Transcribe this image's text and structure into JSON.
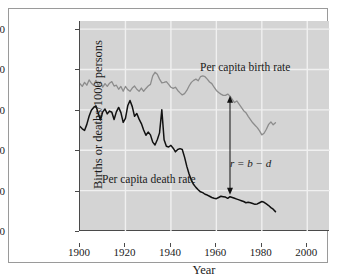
{
  "figure": {
    "background": "#ffffff",
    "plot_background": "#d4d4d4",
    "axis_color": "#4a4a4a",
    "gridline_color": "#f0f0f0",
    "frame_color": "#9a9a9a"
  },
  "axes": {
    "ylabel": "Births or deaths/1000 persons",
    "xlabel": "Year",
    "yticks": [
      "0",
      "10",
      "20",
      "30",
      "40",
      "50"
    ],
    "xticks": [
      "1900",
      "1920",
      "1940",
      "1960",
      "1980",
      "2000"
    ]
  },
  "annotations": {
    "birth_label": "Per capita birth rate",
    "death_label": "Per capita death rate",
    "rate_equation": "r = b − d"
  },
  "chart_data": {
    "type": "line",
    "title": "",
    "xlabel": "Year",
    "ylabel": "Births or deaths/1000 persons",
    "xlim": [
      1900,
      2010
    ],
    "ylim": [
      0,
      52
    ],
    "xticks": [
      1900,
      1920,
      1940,
      1960,
      1980,
      2000
    ],
    "yticks": [
      0,
      10,
      20,
      30,
      40,
      50
    ],
    "grid": true,
    "legend": "inline-annotations",
    "annotations": [
      {
        "text": "Per capita birth rate",
        "x": 1955,
        "y": 44
      },
      {
        "text": "Per capita death rate",
        "x": 1912,
        "y": 16
      },
      {
        "text": "r = b − d",
        "x": 1967,
        "y": 20.5,
        "arrow": {
          "x": 1966,
          "y_top": 33.5,
          "y_bottom": 9.0,
          "style": "double-headed"
        }
      }
    ],
    "series": [
      {
        "name": "Per capita birth rate",
        "color": "#8c8c8c",
        "x": [
          1900,
          1901,
          1902,
          1903,
          1904,
          1905,
          1906,
          1907,
          1908,
          1909,
          1910,
          1911,
          1912,
          1913,
          1914,
          1915,
          1916,
          1917,
          1918,
          1919,
          1920,
          1921,
          1922,
          1923,
          1924,
          1925,
          1926,
          1927,
          1928,
          1929,
          1930,
          1931,
          1932,
          1933,
          1934,
          1935,
          1936,
          1937,
          1938,
          1939,
          1940,
          1941,
          1942,
          1943,
          1944,
          1945,
          1946,
          1947,
          1948,
          1949,
          1950,
          1951,
          1952,
          1953,
          1954,
          1955,
          1956,
          1957,
          1958,
          1959,
          1960,
          1961,
          1962,
          1963,
          1964,
          1965,
          1966,
          1967,
          1968,
          1969,
          1970,
          1971,
          1972,
          1973,
          1974,
          1975,
          1976,
          1977,
          1978,
          1979,
          1980,
          1981,
          1982,
          1983,
          1984,
          1985,
          1986
        ],
        "y": [
          36.5,
          35.8,
          36.8,
          36.1,
          37.4,
          36.6,
          36.1,
          37.3,
          36.0,
          36.9,
          35.6,
          36.5,
          35.8,
          36.6,
          37.0,
          35.9,
          36.1,
          35.1,
          35.8,
          34.6,
          35.8,
          35.0,
          34.6,
          35.4,
          35.9,
          35.1,
          34.6,
          35.4,
          34.6,
          35.3,
          35.9,
          36.3,
          38.4,
          39.3,
          38.8,
          37.6,
          36.7,
          36.8,
          37.0,
          36.3,
          35.6,
          35.3,
          35.6,
          34.8,
          34.2,
          33.7,
          34.0,
          34.8,
          35.9,
          36.8,
          37.3,
          37.6,
          37.2,
          38.2,
          38.4,
          38.2,
          37.6,
          36.9,
          36.5,
          35.6,
          34.8,
          34.3,
          33.9,
          33.6,
          33.6,
          33.9,
          33.4,
          32.6,
          31.8,
          32.2,
          31.4,
          30.6,
          29.8,
          29.3,
          28.4,
          27.6,
          26.8,
          26.2,
          25.6,
          24.8,
          23.8,
          24.2,
          25.2,
          26.4,
          27.0,
          26.3,
          26.8
        ]
      },
      {
        "name": "Per capita death rate",
        "color": "#111111",
        "x": [
          1900,
          1901,
          1902,
          1903,
          1904,
          1905,
          1906,
          1907,
          1908,
          1909,
          1910,
          1911,
          1912,
          1913,
          1914,
          1915,
          1916,
          1917,
          1918,
          1919,
          1920,
          1921,
          1922,
          1923,
          1924,
          1925,
          1926,
          1927,
          1928,
          1929,
          1930,
          1931,
          1932,
          1933,
          1934,
          1935,
          1936,
          1937,
          1938,
          1939,
          1940,
          1941,
          1942,
          1943,
          1944,
          1945,
          1946,
          1947,
          1948,
          1949,
          1950,
          1951,
          1952,
          1953,
          1954,
          1955,
          1956,
          1957,
          1958,
          1959,
          1960,
          1961,
          1962,
          1963,
          1964,
          1965,
          1966,
          1967,
          1968,
          1969,
          1970,
          1971,
          1972,
          1973,
          1974,
          1975,
          1976,
          1977,
          1978,
          1979,
          1980,
          1981,
          1982,
          1983,
          1984,
          1985,
          1986
        ],
        "y": [
          25.9,
          25.3,
          24.9,
          26.4,
          28.4,
          29.9,
          30.6,
          31.0,
          29.2,
          27.5,
          29.5,
          30.2,
          29.0,
          29.7,
          29.4,
          27.6,
          29.5,
          30.6,
          29.3,
          26.9,
          27.9,
          31.0,
          32.3,
          30.8,
          28.4,
          29.1,
          27.7,
          26.6,
          25.0,
          23.7,
          24.5,
          23.8,
          22.0,
          21.3,
          22.6,
          24.3,
          30.0,
          22.6,
          21.0,
          20.8,
          21.2,
          20.5,
          19.6,
          20.2,
          20.4,
          20.2,
          18.3,
          16.0,
          14.1,
          12.6,
          11.5,
          10.8,
          10.2,
          9.7,
          9.5,
          9.1,
          8.9,
          8.6,
          8.3,
          8.1,
          8.0,
          8.3,
          8.6,
          8.5,
          8.4,
          8.1,
          8.5,
          8.3,
          8.1,
          7.9,
          7.7,
          7.5,
          7.3,
          7.0,
          7.1,
          7.0,
          6.8,
          6.6,
          6.7,
          7.0,
          7.3,
          7.1,
          6.7,
          6.3,
          5.8,
          5.4,
          4.8
        ]
      }
    ]
  }
}
